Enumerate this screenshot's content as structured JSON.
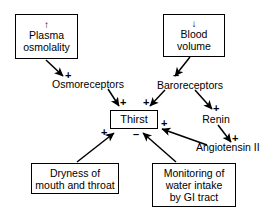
{
  "diagram": {
    "background_color": "#ffffff",
    "line_color": "#000000",
    "nodes": {
      "plasma_osmolality": {
        "direction_arrow": "↑",
        "line1": "Plasma",
        "line2": "osmolality"
      },
      "blood_volume": {
        "direction_arrow": "↓",
        "line1": "Blood",
        "line2": "volume"
      },
      "osmoreceptors": {
        "label": "Osmoreceptors"
      },
      "baroreceptors": {
        "label": "Baroreceptors"
      },
      "thirst": {
        "label": "Thirst"
      },
      "renin": {
        "label": "Renin"
      },
      "angiotensin": {
        "label": "Angiotensin II"
      },
      "dryness": {
        "line1": "Dryness of",
        "line2": "mouth and throat"
      },
      "gi_monitoring": {
        "line1": "Monitoring of",
        "line2": "water intake",
        "line3": "by GI tract"
      }
    },
    "signs": {
      "plasma_to_osmoreceptors": "+",
      "osmoreceptors_to_thirst": "+",
      "blood_to_baroreceptors": "–",
      "baroreceptors_to_thirst": "+",
      "baroreceptors_to_renin": "+",
      "renin_to_angiotensin": "+",
      "angiotensin_to_thirst": "+",
      "dryness_to_thirst": "+",
      "gi_to_thirst": "–"
    }
  }
}
